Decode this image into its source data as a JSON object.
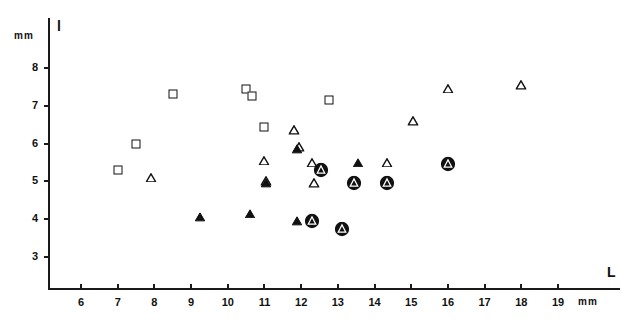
{
  "axes": {
    "y": {
      "title": "l",
      "unit": "mm",
      "ticks": [
        3,
        4,
        5,
        6,
        7,
        8
      ],
      "min": 2.35,
      "max": 8.5
    },
    "x": {
      "title": "L",
      "unit": "mm",
      "ticks": [
        6,
        7,
        8,
        9,
        10,
        11,
        12,
        13,
        14,
        15,
        16,
        17,
        18,
        19
      ],
      "min": 5.1,
      "max": 20.2
    }
  },
  "chart_data": {
    "type": "scatter",
    "title": "",
    "xlabel": "L",
    "ylabel": "l",
    "xunit": "mm",
    "yunit": "mm",
    "xlim": [
      5.1,
      20.2
    ],
    "ylim": [
      2.35,
      8.5
    ],
    "xticks": [
      6,
      7,
      8,
      9,
      10,
      11,
      12,
      13,
      14,
      15,
      16,
      17,
      18,
      19
    ],
    "yticks": [
      3,
      4,
      5,
      6,
      7,
      8
    ],
    "grid": false,
    "legend": "none",
    "series": [
      {
        "name": "open-square",
        "marker": "open-square",
        "points": [
          {
            "x": 7.0,
            "y": 5.3
          },
          {
            "x": 7.5,
            "y": 6.0
          },
          {
            "x": 8.5,
            "y": 7.3
          },
          {
            "x": 10.5,
            "y": 7.45
          },
          {
            "x": 10.65,
            "y": 7.25
          },
          {
            "x": 11.0,
            "y": 6.45
          },
          {
            "x": 12.75,
            "y": 7.15
          }
        ]
      },
      {
        "name": "open-triangle",
        "marker": "open-triangle",
        "points": [
          {
            "x": 7.9,
            "y": 5.1
          },
          {
            "x": 11.0,
            "y": 5.55
          },
          {
            "x": 11.05,
            "y": 5.0
          },
          {
            "x": 11.8,
            "y": 6.35
          },
          {
            "x": 11.95,
            "y": 5.9
          },
          {
            "x": 12.3,
            "y": 5.5
          },
          {
            "x": 12.35,
            "y": 4.95
          },
          {
            "x": 14.35,
            "y": 5.5
          },
          {
            "x": 15.05,
            "y": 6.6
          },
          {
            "x": 16.0,
            "y": 7.45
          },
          {
            "x": 18.0,
            "y": 7.55
          }
        ]
      },
      {
        "name": "filled-triangle",
        "marker": "filled-triangle",
        "points": [
          {
            "x": 9.25,
            "y": 4.05
          },
          {
            "x": 10.6,
            "y": 4.15
          },
          {
            "x": 11.05,
            "y": 4.95
          },
          {
            "x": 11.9,
            "y": 5.85
          },
          {
            "x": 11.9,
            "y": 3.95
          },
          {
            "x": 13.55,
            "y": 5.5
          }
        ]
      },
      {
        "name": "circled-filled-triangle",
        "marker": "circled-filled-triangle",
        "points": [
          {
            "x": 12.3,
            "y": 3.95
          },
          {
            "x": 12.55,
            "y": 5.3
          },
          {
            "x": 13.1,
            "y": 3.75
          },
          {
            "x": 13.45,
            "y": 4.95
          },
          {
            "x": 14.35,
            "y": 4.95
          },
          {
            "x": 16.0,
            "y": 5.45
          }
        ]
      }
    ]
  }
}
